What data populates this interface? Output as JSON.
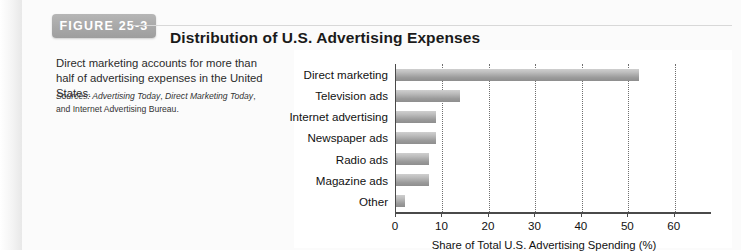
{
  "figure": {
    "tab_label": "FIGURE 25-3",
    "caption": "Direct marketing accounts for more than half of advertising expenses in the United States.",
    "sources_label": "Sources:",
    "source_1": "Advertising Today",
    "source_sep_1": ", ",
    "source_2": "Direct Marketing Today",
    "source_sep_2": ", and ",
    "source_3": "Internet Advertising Bureau."
  },
  "chart_data": {
    "type": "bar",
    "orientation": "horizontal",
    "title": "Distribution of U.S. Advertising Expenses",
    "xlabel": "Share of Total U.S. Advertising Spending (%)",
    "ylabel": "",
    "categories": [
      "Direct marketing",
      "Television ads",
      "Internet advertising",
      "Newspaper ads",
      "Radio ads",
      "Magazine ads",
      "Other"
    ],
    "values": [
      52.3,
      13.7,
      8.5,
      8.5,
      7.0,
      7.0,
      2.0
    ],
    "xlim": [
      0,
      68
    ],
    "xticks": [
      0,
      10,
      20,
      30,
      40,
      50,
      60
    ],
    "xtick_labels": [
      "0",
      "10",
      "20",
      "30",
      "40",
      "50",
      "60"
    ],
    "grid": "vertical-dotted",
    "legend": "none",
    "bar_color": "#a8a8a8"
  }
}
